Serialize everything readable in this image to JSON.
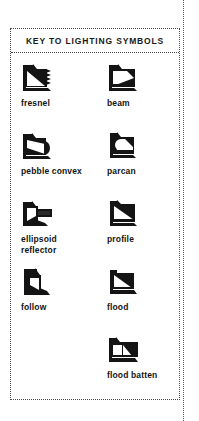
{
  "page": {
    "background_color": "#ffffff",
    "ink_color": "#1a1a1a",
    "border_style": "dotted",
    "border_color": "#4a4a4a"
  },
  "key_box": {
    "title": "KEY TO LIGHTING SYMBOLS"
  },
  "symbols": [
    {
      "label": "fresnel",
      "icon_name": "fresnel-lantern-icon",
      "column": "left",
      "row": 1,
      "description": "dark square body with white triangular beam wedge and jagged fresnel lens edge on right"
    },
    {
      "label": "beam",
      "icon_name": "beam-light-icon",
      "column": "right",
      "row": 1,
      "description": "dark square with white wedge opening to the right, dark corner block"
    },
    {
      "label": "pebble convex",
      "icon_name": "pebble-convex-lantern-icon",
      "column": "left",
      "row": 2,
      "description": "dark square with white sloped wedge and rounded convex lens bulge at right"
    },
    {
      "label": "parcan",
      "icon_name": "parcan-icon",
      "column": "right",
      "row": 2,
      "description": "dark square with white circular par lamp disc at left and dark sloped body"
    },
    {
      "label": "ellipsoid\nreflector",
      "icon_name": "ellipsoid-reflector-icon",
      "column": "left",
      "row": 3,
      "description": "dark angular body with extended barrel projecting right"
    },
    {
      "label": "profile",
      "icon_name": "profile-spot-icon",
      "column": "right",
      "row": 3,
      "description": "dark square with white rectangular opening and diagonal shading"
    },
    {
      "label": "follow",
      "icon_name": "followspot-icon",
      "column": "left",
      "row": 4,
      "description": "tall dark body on stand with white vertical slot"
    },
    {
      "label": "flood",
      "icon_name": "floodlight-icon",
      "column": "right",
      "row": 4,
      "description": "dark square with white triangular half and diagonal split"
    },
    {
      "label": "flood batten",
      "icon_name": "flood-batten-icon",
      "column": "right",
      "row": 5,
      "description": "wide dark bar with two white panel cells, multiple flood compartments"
    }
  ]
}
